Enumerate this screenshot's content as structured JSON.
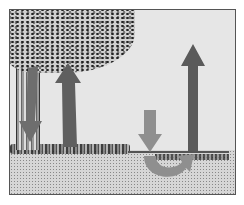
{
  "figure": {
    "title": "",
    "elements": [
      {
        "id": "canopy",
        "label": "tree canopy"
      },
      {
        "id": "trunk",
        "label": "tree trunk"
      },
      {
        "id": "arrow-down-left",
        "label": "downward arrow under tree",
        "direction": "down",
        "color": "#6e6e6e"
      },
      {
        "id": "arrow-up-left",
        "label": "upward arrow under tree",
        "direction": "up",
        "color": "#5f5f5f"
      },
      {
        "id": "arrow-up-right",
        "label": "tall upward arrow in open area",
        "direction": "up",
        "color": "#5a5a5a"
      },
      {
        "id": "arrow-curved-right",
        "label": "downward arrow curving into soil",
        "direction": "down-then-curve-right",
        "color": "#8f8f8f"
      }
    ],
    "colors": {
      "sky": "#e6e6e6",
      "frame": "#555555",
      "dark_arrow": "#5a5a5a",
      "light_arrow": "#8f8f8f"
    }
  }
}
